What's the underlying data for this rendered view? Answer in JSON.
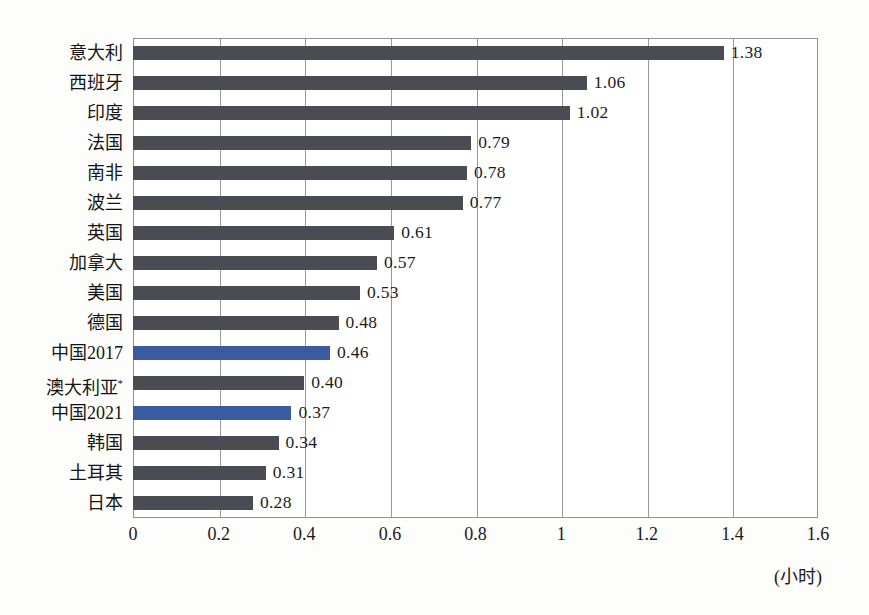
{
  "chart_data": {
    "type": "bar",
    "orientation": "horizontal",
    "title": "",
    "xlabel": "(小时)",
    "ylabel": "",
    "xlim": [
      0,
      1.6
    ],
    "xticks": [
      "0",
      "0.2",
      "0.4",
      "0.6",
      "0.8",
      "1",
      "1.2",
      "1.4",
      "1.6"
    ],
    "xtick_values": [
      0,
      0.2,
      0.4,
      0.6,
      0.8,
      1,
      1.2,
      1.4,
      1.6
    ],
    "grid": true,
    "legend": "none",
    "categories": [
      "意大利",
      "西班牙",
      "印度",
      "法国",
      "南非",
      "波兰",
      "英国",
      "加拿大",
      "美国",
      "德国",
      "中国2017",
      "澳大利亚*",
      "中国2021",
      "韩国",
      "土耳其",
      "日本"
    ],
    "values": [
      1.38,
      1.06,
      1.02,
      0.79,
      0.78,
      0.77,
      0.61,
      0.57,
      0.53,
      0.48,
      0.46,
      0.4,
      0.37,
      0.34,
      0.31,
      0.28
    ],
    "value_labels": [
      "1.38",
      "1.06",
      "1.02",
      "0.79",
      "0.78",
      "0.77",
      "0.61",
      "0.57",
      "0.53",
      "0.48",
      "0.46",
      "0.40",
      "0.37",
      "0.34",
      "0.31",
      "0.28"
    ],
    "highlighted_categories": [
      "中国2017",
      "中国2021"
    ],
    "colors": {
      "bar": "#4b4b53",
      "bar_highlight": "#3a5ba0",
      "grid": "#9a9a9e",
      "frame": "#8f8f93",
      "text": "#141414",
      "background": "#fdfdfc"
    }
  }
}
